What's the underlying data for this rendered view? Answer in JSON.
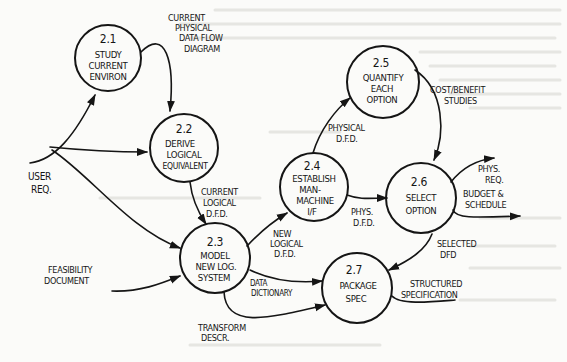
{
  "diagram": {
    "type": "data-flow-diagram",
    "ink_color": "#151515",
    "paper_color": "#fbfbf9",
    "processes": [
      {
        "id": "2.1",
        "lines": [
          "STUDY",
          "CURRENT",
          "ENVIRON"
        ]
      },
      {
        "id": "2.2",
        "lines": [
          "DERIVE",
          "LOGICAL",
          "EQUIVALENT"
        ]
      },
      {
        "id": "2.3",
        "lines": [
          "MODEL",
          "NEW LOG.",
          "SYSTEM"
        ]
      },
      {
        "id": "2.4",
        "lines": [
          "ESTABLISH",
          "MAN-",
          "MACHINE",
          "I/F"
        ]
      },
      {
        "id": "2.5",
        "lines": [
          "QUANTIFY",
          "EACH",
          "OPTION"
        ]
      },
      {
        "id": "2.6",
        "lines": [
          "SELECT",
          "OPTION"
        ]
      },
      {
        "id": "2.7",
        "lines": [
          "PACKAGE",
          "SPEC"
        ]
      }
    ],
    "external_inputs": {
      "user_req": [
        "USER",
        "REQ."
      ],
      "feasibility": [
        "FEASIBILITY",
        "DOCUMENT"
      ]
    },
    "flows": {
      "current_physical_dfd": [
        "CURRENT",
        "PHYSICAL",
        "DATA FLOW",
        "DIAGRAM"
      ],
      "current_logical_dfd": [
        "CURRENT",
        "LOGICAL",
        "D.F.D."
      ],
      "new_logical_dfd": [
        "NEW",
        "LOGICAL",
        "D.F.D."
      ],
      "physical_dfd": [
        "PHYSICAL",
        "D.F.D."
      ],
      "phys_dfd": [
        "PHYS.",
        "D.F.D."
      ],
      "cost_benefit": [
        "COST/BENEFIT",
        "STUDIES"
      ],
      "phys_req": [
        "PHYS.",
        "REQ."
      ],
      "budget_schedule": [
        "BUDGET &",
        "SCHEDULE"
      ],
      "selected_dfd": [
        "SELECTED",
        "DFD"
      ],
      "data_dictionary": [
        "DATA",
        "DICTIONARY"
      ],
      "transform_descr": [
        "TRANSFORM",
        "DESCR."
      ],
      "structured_spec": [
        "STRUCTURED",
        "SPECIFICATION"
      ]
    }
  }
}
